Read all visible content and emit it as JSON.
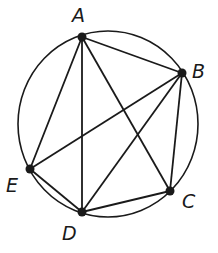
{
  "figure": {
    "stroke_color": "#1a1a1a",
    "background": "#ffffff",
    "circle": {
      "cx": 108,
      "cy": 124,
      "rx": 90,
      "ry": 93
    },
    "points": [
      {
        "id": "A",
        "label": "A",
        "x": 82,
        "y": 37,
        "label_x": 72,
        "label_y": 22
      },
      {
        "id": "B",
        "label": "B",
        "x": 182,
        "y": 73,
        "label_x": 192,
        "label_y": 78
      },
      {
        "id": "C",
        "label": "C",
        "x": 170,
        "y": 191,
        "label_x": 182,
        "label_y": 208
      },
      {
        "id": "D",
        "label": "D",
        "x": 82,
        "y": 212,
        "label_x": 62,
        "label_y": 240
      },
      {
        "id": "E",
        "label": "E",
        "x": 30,
        "y": 169,
        "label_x": 6,
        "label_y": 192
      }
    ],
    "segments": [
      [
        "A",
        "B"
      ],
      [
        "A",
        "C"
      ],
      [
        "A",
        "D"
      ],
      [
        "A",
        "E"
      ],
      [
        "B",
        "C"
      ],
      [
        "B",
        "D"
      ],
      [
        "B",
        "E"
      ],
      [
        "C",
        "D"
      ],
      [
        "D",
        "E"
      ]
    ]
  }
}
